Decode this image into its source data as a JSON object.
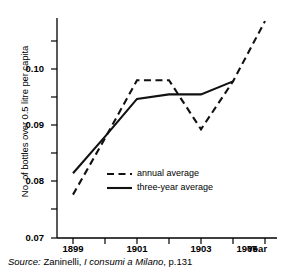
{
  "chart_data": {
    "type": "line",
    "title": "",
    "xlabel": "Year",
    "ylabel": "No. of bottles over 0.5 litre per capita",
    "xlim": [
      1898.5,
      1905.5
    ],
    "ylim": [
      0.07,
      0.109
    ],
    "grid": false,
    "legend_position": "center-left",
    "x_ticks": [
      1899,
      1900,
      1901,
      1902,
      1903,
      1904,
      1905
    ],
    "x_tick_labels": [
      "1899",
      "",
      "1901",
      "",
      "1903",
      "",
      "1905"
    ],
    "y_ticks": [
      0.07,
      0.075,
      0.08,
      0.085,
      0.09,
      0.095,
      0.1,
      0.105
    ],
    "y_tick_labels": [
      "0.07",
      "",
      "0.08",
      "",
      "0.09",
      "",
      "0.10",
      ""
    ],
    "series": [
      {
        "name": "annual average",
        "style": "dashed",
        "x": [
          1899,
          1900,
          1901,
          1902,
          1903,
          1904,
          1905
        ],
        "values": [
          0.0777,
          0.0877,
          0.098,
          0.098,
          0.0893,
          0.0978,
          0.1085
        ]
      },
      {
        "name": "three-year average",
        "style": "solid",
        "x": [
          1899,
          1900,
          1901,
          1902,
          1903,
          1904
        ],
        "values": [
          0.0815,
          0.088,
          0.0947,
          0.0955,
          0.0955,
          0.0978
        ]
      }
    ]
  },
  "legend": {
    "items": [
      {
        "label": "annual average"
      },
      {
        "label": "three-year average"
      }
    ]
  },
  "axes": {
    "y_title": "No. of bottles over 0.5 litre per capita",
    "x_title": "Year"
  },
  "source": {
    "prefix": "Source:",
    "author": "Zaninelli,",
    "work": "I consumi a Milano",
    "page": ", p.131"
  }
}
